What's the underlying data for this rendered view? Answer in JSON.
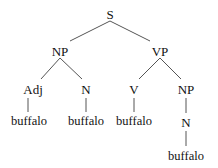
{
  "tree": {
    "root": "S",
    "nodes": [
      {
        "id": "s",
        "label": "S",
        "x": 110,
        "y": 14
      },
      {
        "id": "np1",
        "label": "NP",
        "x": 60,
        "y": 51
      },
      {
        "id": "vp",
        "label": "VP",
        "x": 160,
        "y": 51
      },
      {
        "id": "adj",
        "label": "Adj",
        "x": 37,
        "y": 89
      },
      {
        "id": "n1",
        "label": "N",
        "x": 86,
        "y": 89
      },
      {
        "id": "v",
        "label": "V",
        "x": 134,
        "y": 89
      },
      {
        "id": "np2",
        "label": "NP",
        "x": 186,
        "y": 89
      },
      {
        "id": "w1",
        "label": "buffalo",
        "x": 37,
        "y": 121,
        "leaf": true
      },
      {
        "id": "w2",
        "label": "buffalo",
        "x": 86,
        "y": 121,
        "leaf": true
      },
      {
        "id": "w3",
        "label": "buffalo",
        "x": 134,
        "y": 121,
        "leaf": true
      },
      {
        "id": "n2",
        "label": "N",
        "x": 186,
        "y": 122
      },
      {
        "id": "w4",
        "label": "buffalo",
        "x": 186,
        "y": 156,
        "leaf": true
      }
    ],
    "edges": [
      {
        "from": [
          110,
          21
        ],
        "to": [
          70,
          41
        ]
      },
      {
        "from": [
          110,
          21
        ],
        "to": [
          150,
          41
        ]
      },
      {
        "from": [
          60,
          58
        ],
        "to": [
          41,
          79
        ]
      },
      {
        "from": [
          60,
          58
        ],
        "to": [
          82,
          79
        ]
      },
      {
        "from": [
          160,
          58
        ],
        "to": [
          139,
          79
        ]
      },
      {
        "from": [
          160,
          58
        ],
        "to": [
          181,
          79
        ]
      },
      {
        "from": [
          28,
          98
        ],
        "to": [
          28,
          112
        ]
      },
      {
        "from": [
          86,
          98
        ],
        "to": [
          86,
          112
        ]
      },
      {
        "from": [
          134,
          98
        ],
        "to": [
          134,
          112
        ]
      },
      {
        "from": [
          186,
          98
        ],
        "to": [
          186,
          113
        ]
      },
      {
        "from": [
          186,
          131
        ],
        "to": [
          186,
          146
        ]
      }
    ]
  },
  "labels": {
    "s": "S",
    "np1": "NP",
    "vp": "VP",
    "adj": "Adj",
    "n1": "N",
    "v": "V",
    "np2": "NP",
    "n2": "N",
    "w1": "buffalo",
    "w2": "buffalo",
    "w3": "buffalo",
    "w4": "buffalo"
  }
}
